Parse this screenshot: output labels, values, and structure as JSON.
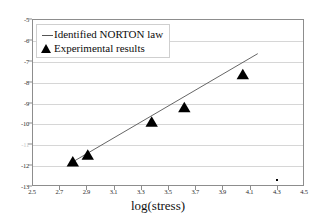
{
  "chart_data": {
    "type": "scatter",
    "title": "",
    "subtitle": "",
    "xlabel": "log(stress)",
    "ylabel": "",
    "xlim": [
      2.5,
      4.5
    ],
    "ylim": [
      -13,
      -5
    ],
    "xticks": [
      "2.5",
      "2.7",
      "2.9",
      "3.1",
      "3.3",
      "3.5",
      "3.7",
      "3.9",
      "4.1",
      "4.3",
      "4.5"
    ],
    "xtick_values": [
      2.5,
      2.7,
      2.9,
      3.1,
      3.3,
      3.5,
      3.7,
      3.9,
      4.1,
      4.3,
      4.5
    ],
    "yticks": [
      "-5",
      "-6",
      "-7",
      "-8",
      "-9",
      "-10",
      "-11",
      "-12",
      "-13"
    ],
    "ytick_values": [
      -5,
      -6,
      -7,
      -8,
      -9,
      -10,
      -11,
      -12,
      -13
    ],
    "ytick_faded": [
      -11
    ],
    "grid": "horizontal",
    "legend_position": "top-left",
    "series": [
      {
        "name": "Identified NORTON law",
        "type": "line",
        "marker": "none",
        "color": "#555555",
        "x": [
          2.78,
          4.16
        ],
        "values": [
          -11.92,
          -6.66
        ]
      },
      {
        "name": "Experimental results",
        "type": "scatter",
        "marker": "triangle-up",
        "color": "#000000",
        "x": [
          2.8,
          2.91,
          3.38,
          3.62,
          4.05
        ],
        "values": [
          -11.88,
          -11.55,
          -9.97,
          -9.27,
          -7.7
        ]
      }
    ],
    "annotations": [
      {
        "name": "stray-dot",
        "x": 4.3,
        "y": -12.7
      }
    ]
  },
  "legend": {
    "items": [
      {
        "key": "line-key",
        "label": "Identified NORTON law"
      },
      {
        "key": "triangle-key",
        "label": "Experimental results"
      }
    ]
  },
  "colors": {
    "line": "#555555",
    "marker": "#000000",
    "grid": "#d6d6d6",
    "axis": "#8d8d8d",
    "text": "#2b2b2b"
  }
}
